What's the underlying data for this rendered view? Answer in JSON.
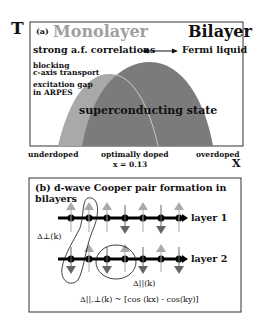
{
  "panel_a": {
    "axis_y_label": "T",
    "axis_x_label": "x",
    "tag": "(a)",
    "left_title": "Monolayer",
    "right_title": "Bilayer",
    "left_regime": "strong a.f. correlations",
    "right_regime": "Fermi liquid",
    "note_1_line1": "blocking",
    "note_1_line2": "c-axis transport",
    "note_2_line1": "excitation gap",
    "note_2_line2": "in ARPES",
    "dome_label": "superconducting state",
    "x_ticks": [
      "underdoped",
      "optimally doped",
      "overdoped"
    ],
    "optimal_value": "x = 0.13",
    "colors": {
      "monolayer_dome": "#a8a8a8",
      "bilayer_dome": "#7a7a7a",
      "monolayer_title": "#a0a0a0"
    }
  },
  "panel_b": {
    "title": "(b) d-wave Cooper pair formation in bilayers",
    "layer_1": "layer 1",
    "layer_2": "layer 2",
    "delta_perp": "Δ⊥(k)",
    "delta_par": "Δ||(k)",
    "formula": "Δ||,⊥(k) ~ [cos (kx) - cos(ky)]",
    "layer1_spins": [
      "up",
      "up",
      "up",
      "down",
      "up",
      "down",
      "up"
    ],
    "layer2_spins": [
      "down",
      "up",
      "down",
      "up",
      "down",
      "up",
      "down"
    ]
  }
}
